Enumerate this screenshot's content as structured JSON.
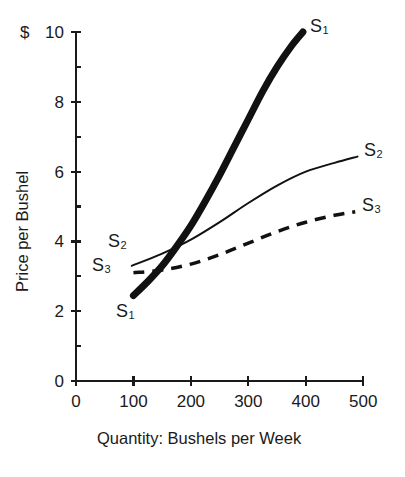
{
  "chart_data": {
    "type": "line",
    "title": "",
    "xlabel": "Quantity: Bushels per Week",
    "ylabel": "Price per Bushel",
    "currency_symbol": "$",
    "xlim": [
      0,
      500
    ],
    "ylim": [
      0,
      10
    ],
    "xticks": [
      0,
      100,
      200,
      300,
      400,
      500
    ],
    "xtick_labels": [
      "0",
      "100",
      "200",
      "300",
      "400",
      "500"
    ],
    "yticks": [
      0,
      2,
      4,
      6,
      8,
      10
    ],
    "ytick_labels": [
      "0",
      "2",
      "4",
      "6",
      "8",
      "10"
    ],
    "yminor_ticks": [
      1,
      3,
      5,
      7,
      9
    ],
    "grid": false,
    "legend": "inline-curve-labels",
    "series": [
      {
        "name": "S1",
        "label": "S",
        "subscript": "1",
        "style": "thick-solid",
        "linewidth": 7,
        "color": "#111111",
        "points": [
          [
            100,
            2.45
          ],
          [
            125,
            2.85
          ],
          [
            150,
            3.3
          ],
          [
            175,
            3.85
          ],
          [
            200,
            4.45
          ],
          [
            225,
            5.15
          ],
          [
            250,
            5.9
          ],
          [
            275,
            6.7
          ],
          [
            300,
            7.5
          ],
          [
            325,
            8.3
          ],
          [
            350,
            9.0
          ],
          [
            375,
            9.6
          ],
          [
            395,
            10.0
          ]
        ],
        "start_label_pos": [
          110,
          1.95
        ],
        "end_label_pos": [
          408,
          9.95
        ]
      },
      {
        "name": "S2",
        "label": "S",
        "subscript": "2",
        "style": "thin-solid",
        "linewidth": 2,
        "color": "#111111",
        "points": [
          [
            97,
            3.3
          ],
          [
            150,
            3.65
          ],
          [
            200,
            4.05
          ],
          [
            250,
            4.55
          ],
          [
            300,
            5.1
          ],
          [
            350,
            5.6
          ],
          [
            400,
            6.0
          ],
          [
            450,
            6.25
          ],
          [
            490,
            6.43
          ]
        ],
        "end_label_pos": [
          500,
          6.55
        ]
      },
      {
        "name": "S3",
        "label": "S",
        "subscript": "3",
        "style": "dashed",
        "linewidth": 3.5,
        "dash": "11 8",
        "color": "#111111",
        "points": [
          [
            100,
            3.1
          ],
          [
            150,
            3.18
          ],
          [
            200,
            3.35
          ],
          [
            250,
            3.62
          ],
          [
            300,
            3.95
          ],
          [
            350,
            4.28
          ],
          [
            400,
            4.55
          ],
          [
            450,
            4.75
          ],
          [
            486,
            4.85
          ]
        ],
        "end_label_pos": [
          497,
          5.0
        ]
      }
    ],
    "inline_labels": [
      {
        "name": "s1-upper-label",
        "text": "S",
        "sub": "1",
        "x": 310,
        "y": 17
      },
      {
        "name": "s1-lower-label",
        "text": "S",
        "sub": "1",
        "x": 116,
        "y": 302
      },
      {
        "name": "s2-left-label",
        "text": "S",
        "sub": "2",
        "x": 108,
        "y": 232
      },
      {
        "name": "s2-right-label",
        "text": "S",
        "sub": "2",
        "x": 364,
        "y": 141
      },
      {
        "name": "s3-left-label",
        "text": "S",
        "sub": "3",
        "x": 92,
        "y": 256
      },
      {
        "name": "s3-right-label",
        "text": "S",
        "sub": "3",
        "x": 362,
        "y": 196
      }
    ]
  },
  "axes": {
    "origin_px": [
      76,
      381
    ],
    "x_unit_px": 0.5745,
    "y_unit_px": 34.9
  }
}
